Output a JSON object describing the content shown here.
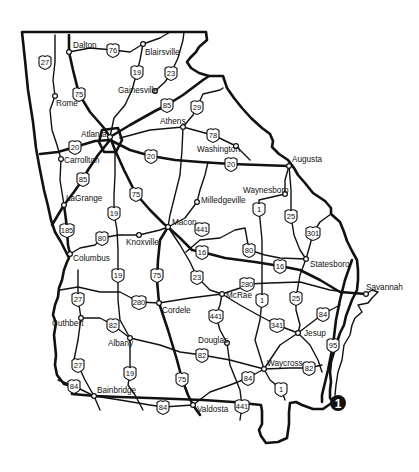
{
  "map": {
    "region": "Georgia",
    "colors": {
      "ink": "#111111",
      "background": "#ffffff",
      "marker": "#111111",
      "marker_text": "#ffffff"
    },
    "cities": [
      {
        "id": "dalton",
        "name": "Dalton",
        "x": 69,
        "y": 52,
        "lx": 73,
        "ly": 48
      },
      {
        "id": "blairsville",
        "name": "Blairsville",
        "x": 143,
        "y": 44,
        "lx": 145,
        "ly": 55
      },
      {
        "id": "rome",
        "name": "Rome",
        "x": 55,
        "y": 96,
        "lx": 56,
        "ly": 106
      },
      {
        "id": "gainesville",
        "name": "Gainesville",
        "x": 155,
        "y": 91,
        "lx": 118,
        "ly": 93
      },
      {
        "id": "athens",
        "name": "Athens",
        "x": 183,
        "y": 127,
        "lx": 160,
        "ly": 124
      },
      {
        "id": "atlanta",
        "name": "Atlanta",
        "x": 110,
        "y": 137,
        "lx": 81,
        "ly": 137
      },
      {
        "id": "washington",
        "name": "Washington",
        "x": 236,
        "y": 146,
        "lx": 197,
        "ly": 152
      },
      {
        "id": "carrollton",
        "name": "Carrollton",
        "x": 61,
        "y": 159,
        "lx": 64,
        "ly": 163
      },
      {
        "id": "augusta",
        "name": "Augusta",
        "x": 289,
        "y": 166,
        "lx": 292,
        "ly": 162
      },
      {
        "id": "waynesboro",
        "name": "Waynesboro",
        "x": 285,
        "y": 194,
        "lx": 243,
        "ly": 193
      },
      {
        "id": "milledgeville",
        "name": "Milledgeville",
        "x": 197,
        "y": 202,
        "lx": 201,
        "ly": 203
      },
      {
        "id": "lagrange",
        "name": "LaGrange",
        "x": 64,
        "y": 205,
        "lx": 66,
        "ly": 201
      },
      {
        "id": "macon",
        "name": "Macon",
        "x": 168,
        "y": 227,
        "lx": 172,
        "ly": 225
      },
      {
        "id": "knoxville",
        "name": "Knoxville",
        "x": 139,
        "y": 235,
        "lx": 126,
        "ly": 245
      },
      {
        "id": "statesboro",
        "name": "Statesboro",
        "x": 306,
        "y": 259,
        "lx": 310,
        "ly": 267
      },
      {
        "id": "columbus",
        "name": "Columbus",
        "x": 70,
        "y": 254,
        "lx": 73,
        "ly": 261
      },
      {
        "id": "savannah",
        "name": "Savannah",
        "x": 366,
        "y": 294,
        "lx": 366,
        "ly": 290
      },
      {
        "id": "cordele",
        "name": "Cordele",
        "x": 159,
        "y": 303,
        "lx": 162,
        "ly": 313
      },
      {
        "id": "mcrae",
        "name": "McRae",
        "x": 222,
        "y": 294,
        "lx": 226,
        "ly": 298
      },
      {
        "id": "cuthbert",
        "name": "Cuthbert",
        "x": 81,
        "y": 318,
        "lx": 52,
        "ly": 326
      },
      {
        "id": "albany",
        "name": "Albany",
        "x": 130,
        "y": 338,
        "lx": 108,
        "ly": 346
      },
      {
        "id": "jesup",
        "name": "Jesup",
        "x": 298,
        "y": 333,
        "lx": 304,
        "ly": 336
      },
      {
        "id": "douglas",
        "name": "Douglas",
        "x": 227,
        "y": 343,
        "lx": 198,
        "ly": 343
      },
      {
        "id": "waycross",
        "name": "Waycross",
        "x": 264,
        "y": 369,
        "lx": 267,
        "ly": 366
      },
      {
        "id": "bainbridge",
        "name": "Bainbridge",
        "x": 94,
        "y": 396,
        "lx": 97,
        "ly": 393
      },
      {
        "id": "valdosta",
        "name": "Valdosta",
        "x": 193,
        "y": 405,
        "lx": 197,
        "ly": 412
      }
    ],
    "shields": [
      {
        "route": "76",
        "x": 113,
        "y": 50,
        "w": 12
      },
      {
        "route": "27",
        "x": 45,
        "y": 62,
        "w": 12
      },
      {
        "route": "19",
        "x": 137,
        "y": 72,
        "w": 12
      },
      {
        "route": "23",
        "x": 171,
        "y": 73,
        "w": 12
      },
      {
        "route": "75",
        "x": 79,
        "y": 94,
        "w": 12
      },
      {
        "route": "85",
        "x": 167,
        "y": 105,
        "w": 12
      },
      {
        "route": "29",
        "x": 197,
        "y": 107,
        "w": 12
      },
      {
        "route": "78",
        "x": 213,
        "y": 135,
        "w": 12
      },
      {
        "route": "20",
        "x": 75,
        "y": 147,
        "w": 12
      },
      {
        "route": "20",
        "x": 151,
        "y": 156,
        "w": 12
      },
      {
        "route": "20",
        "x": 231,
        "y": 164,
        "w": 12
      },
      {
        "route": "85",
        "x": 83,
        "y": 179,
        "w": 12
      },
      {
        "route": "75",
        "x": 136,
        "y": 194,
        "w": 12
      },
      {
        "route": "1",
        "x": 259,
        "y": 209,
        "w": 12
      },
      {
        "route": "25",
        "x": 291,
        "y": 216,
        "w": 12
      },
      {
        "route": "301",
        "x": 313,
        "y": 233,
        "w": 14
      },
      {
        "route": "19",
        "x": 114,
        "y": 213,
        "w": 12
      },
      {
        "route": "441",
        "x": 202,
        "y": 229,
        "w": 14
      },
      {
        "route": "185",
        "x": 67,
        "y": 230,
        "w": 14
      },
      {
        "route": "80",
        "x": 102,
        "y": 238,
        "w": 12
      },
      {
        "route": "80",
        "x": 249,
        "y": 250,
        "w": 12
      },
      {
        "route": "16",
        "x": 202,
        "y": 252,
        "w": 12
      },
      {
        "route": "16",
        "x": 280,
        "y": 266,
        "w": 12
      },
      {
        "route": "19",
        "x": 118,
        "y": 275,
        "w": 12
      },
      {
        "route": "75",
        "x": 157,
        "y": 275,
        "w": 12
      },
      {
        "route": "23",
        "x": 197,
        "y": 277,
        "w": 12
      },
      {
        "route": "27",
        "x": 78,
        "y": 299,
        "w": 12
      },
      {
        "route": "280",
        "x": 139,
        "y": 302,
        "w": 14
      },
      {
        "route": "280",
        "x": 247,
        "y": 284,
        "w": 14
      },
      {
        "route": "1",
        "x": 262,
        "y": 300,
        "w": 12
      },
      {
        "route": "25",
        "x": 296,
        "y": 298,
        "w": 12
      },
      {
        "route": "82",
        "x": 113,
        "y": 325,
        "w": 12
      },
      {
        "route": "441",
        "x": 216,
        "y": 316,
        "w": 14
      },
      {
        "route": "84",
        "x": 323,
        "y": 314,
        "w": 12
      },
      {
        "route": "341",
        "x": 277,
        "y": 325,
        "w": 14
      },
      {
        "route": "82",
        "x": 202,
        "y": 355,
        "w": 12
      },
      {
        "route": "27",
        "x": 78,
        "y": 365,
        "w": 12
      },
      {
        "route": "19",
        "x": 130,
        "y": 373,
        "w": 12
      },
      {
        "route": "95",
        "x": 333,
        "y": 345,
        "w": 12
      },
      {
        "route": "82",
        "x": 309,
        "y": 368,
        "w": 12
      },
      {
        "route": "75",
        "x": 182,
        "y": 379,
        "w": 12
      },
      {
        "route": "84",
        "x": 248,
        "y": 378,
        "w": 12
      },
      {
        "route": "84",
        "x": 74,
        "y": 386,
        "w": 12
      },
      {
        "route": "1",
        "x": 281,
        "y": 389,
        "w": 12
      },
      {
        "route": "84",
        "x": 163,
        "y": 407,
        "w": 12
      },
      {
        "route": "441",
        "x": 242,
        "y": 406,
        "w": 14
      }
    ],
    "marker": {
      "label": "1",
      "x": 338,
      "y": 403
    }
  }
}
